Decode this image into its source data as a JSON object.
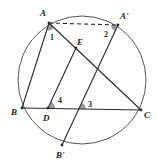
{
  "diagram": {
    "type": "geometry",
    "circle": {
      "cx": 82,
      "cy": 80,
      "r": 64,
      "color": "#555555"
    },
    "points": {
      "A": {
        "x": 49,
        "y": 23,
        "label": "A",
        "lx": 40,
        "ly": 16
      },
      "A'": {
        "x": 118,
        "y": 25,
        "label": "A'",
        "lx": 121,
        "ly": 19
      },
      "B": {
        "x": 22,
        "y": 108,
        "label": "B",
        "lx": 11,
        "ly": 115
      },
      "C": {
        "x": 141,
        "y": 110,
        "label": "C",
        "lx": 144,
        "ly": 118
      },
      "D": {
        "x": 48,
        "y": 108,
        "label": "D",
        "lx": 43,
        "ly": 121
      },
      "E": {
        "x": 76,
        "y": 48,
        "label": "E",
        "lx": 77,
        "ly": 44
      },
      "B'": {
        "x": 62,
        "y": 145,
        "label": "B'",
        "lx": 56,
        "ly": 158
      }
    },
    "angles": [
      {
        "label": "1",
        "x": 50,
        "y": 40
      },
      {
        "label": "2",
        "x": 104,
        "y": 37
      },
      {
        "label": "3",
        "x": 89,
        "y": 108
      },
      {
        "label": "4",
        "x": 59,
        "y": 103
      }
    ],
    "segments": [
      {
        "from": "A",
        "to": "A'",
        "style": "dashed"
      },
      {
        "from": "A",
        "to": "B",
        "style": "solid"
      },
      {
        "from": "A",
        "to": "C",
        "style": "solid"
      },
      {
        "from": "B",
        "to": "C",
        "style": "solid"
      },
      {
        "from": "D",
        "to": "E",
        "style": "solid"
      },
      {
        "from": "A'",
        "to": "B'",
        "style": "solid"
      }
    ],
    "line_color": "#2a2a2a",
    "shade_color": "#9a9a9a"
  }
}
